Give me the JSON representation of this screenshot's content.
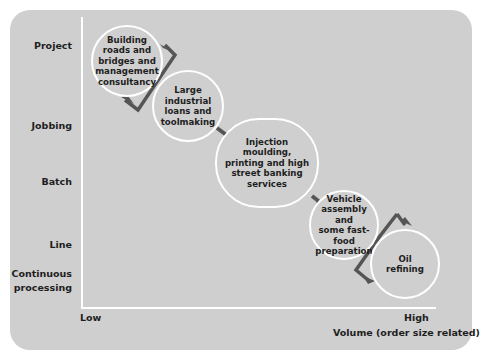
{
  "diagram": {
    "y_axis": {
      "levels": [
        "Project",
        "Jobbing",
        "Batch",
        "Line",
        "Continuous processing"
      ]
    },
    "x_axis": {
      "low_label": "Low",
      "high_label": "High",
      "title": "Volume (order size related)"
    },
    "nodes": [
      {
        "text": "Building roads and bridges and management consultancy",
        "process": "Project"
      },
      {
        "text": "Large industrial loans and toolmaking",
        "process": "Jobbing"
      },
      {
        "text": "Injection moulding, printing and high street banking services",
        "process": "Batch"
      },
      {
        "text": "Vehicle assembly and some fast-food preparation",
        "process": "Line"
      },
      {
        "text": "Oil refining",
        "process": "Continuous processing"
      }
    ],
    "colors": {
      "panel": "#cfcfcf",
      "axis": "#ffffff",
      "arrow": "#555555",
      "text": "#1e1e1e"
    }
  },
  "labels": {
    "project": "Project",
    "jobbing": "Jobbing",
    "batch": "Batch",
    "line": "Line",
    "continuous_1": "Continuous",
    "continuous_2": "processing",
    "low": "Low",
    "high": "High",
    "volume": "Volume (order size related)"
  },
  "node_lines": {
    "n1": [
      "Building",
      "roads and",
      "bridges and",
      "management",
      "consultancy"
    ],
    "n2": [
      "Large",
      "industrial",
      "loans and",
      "toolmaking"
    ],
    "n3": [
      "Injection",
      "moulding,",
      "printing and high",
      "street banking",
      "services"
    ],
    "n4": [
      "Vehicle",
      "assembly and",
      "some fast-food",
      "preparation"
    ],
    "n5": [
      "Oil",
      "refining"
    ]
  }
}
